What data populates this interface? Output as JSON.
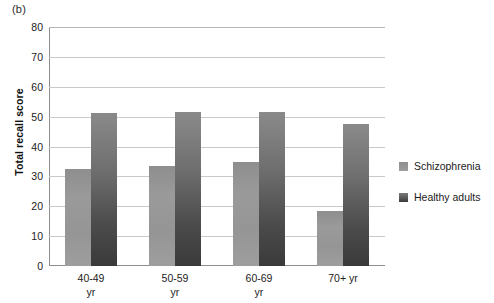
{
  "panel_label": "(b)",
  "chart_data": {
    "type": "bar",
    "title": "",
    "xlabel": "",
    "ylabel": "Total recall score",
    "ylim": [
      0,
      80
    ],
    "ytick_step": 10,
    "yticks": [
      0,
      10,
      20,
      30,
      40,
      50,
      60,
      70,
      80
    ],
    "grid": true,
    "legend_position": "right",
    "categories": [
      "40-49\nyr",
      "50-59\nyr",
      "60-69\nyr",
      "70+ yr"
    ],
    "series": [
      {
        "name": "Schizophrenia",
        "color": "#989898",
        "values": [
          32.5,
          33.5,
          34.7,
          18.5
        ]
      },
      {
        "name": "Healthy adults",
        "color": "#4a4a4a",
        "values": [
          51.3,
          51.4,
          51.6,
          47.6
        ]
      }
    ]
  },
  "axis": {
    "y_title": "Total recall score",
    "y_tick_labels": [
      "80",
      "70",
      "60",
      "50",
      "40",
      "30",
      "20",
      "10",
      "0"
    ],
    "x_tick_labels": [
      "40-49\nyr",
      "50-59\nyr",
      "60-69\nyr",
      "70+ yr"
    ]
  },
  "legend": {
    "entries": [
      {
        "label": "Schizophrenia",
        "swatch": "legend-swatch-schizophrenia"
      },
      {
        "label": "Healthy adults",
        "swatch": "legend-swatch-healthy"
      }
    ]
  }
}
